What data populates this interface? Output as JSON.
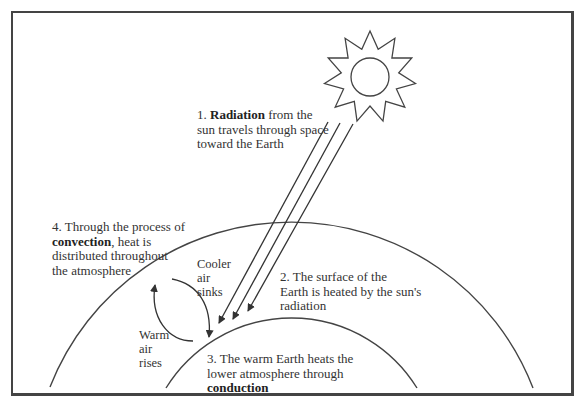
{
  "diagram": {
    "colors": {
      "stroke": "#444444",
      "text": "#333333",
      "background": "#ffffff"
    },
    "elements": {
      "sun": {
        "icon": "sun-icon"
      },
      "earth_surface": {
        "label": "Earth surface arc"
      },
      "atmosphere_boundary": {
        "label": "Atmosphere arc"
      }
    },
    "labels": {
      "step1": {
        "num": "1. ",
        "bold": "Radiation",
        "rest_line1": " from the",
        "line2": "sun travels through space",
        "line3": "toward the Earth"
      },
      "step2": {
        "line1": "2. The surface of the",
        "line2": "Earth is heated by the sun's",
        "line3": "radiation"
      },
      "step3": {
        "line1": "3. The warm Earth heats the",
        "line2": "lower atmosphere through",
        "bold": "conduction"
      },
      "step4": {
        "line1": "4. Through the process of",
        "bold": "convection",
        "rest_line2": ", heat is",
        "line3": "distributed throughout",
        "line4": "the atmosphere"
      },
      "cooler": {
        "line1": "Cooler",
        "line2": "air",
        "line3": "sinks"
      },
      "warm": {
        "line1": "Warm",
        "line2": "air",
        "line3": "rises"
      }
    }
  }
}
